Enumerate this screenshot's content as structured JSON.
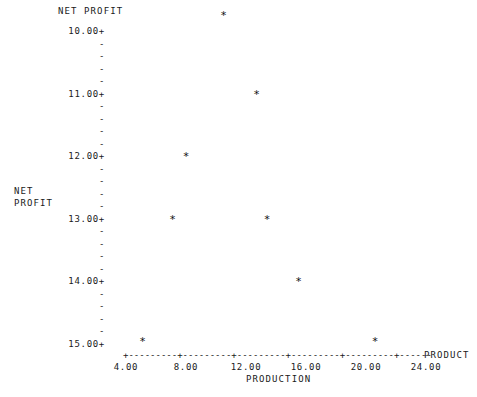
{
  "title": "NET PROFIT",
  "side_label_line1": "NET",
  "side_label_line2": "PROFIT",
  "axis_end_label": "PRODUCT",
  "xaxis_caption": "PRODUCTION",
  "marker_glyph": "*",
  "y_axis": {
    "major_suffix": "+",
    "minor_glyph": "-",
    "labels": [
      "15.00+",
      "14.00+",
      "13.00+",
      "12.00+",
      "11.00+",
      "10.00+"
    ]
  },
  "x_axis": {
    "tick_labels": [
      "4.00",
      "8.00",
      "12.00",
      "16.00",
      "20.00",
      "24.00"
    ],
    "line": "+---------+---------+---------+---------+---------+------"
  },
  "colors": {
    "ink": "#1a1a1a",
    "marker": "#111111",
    "background": "#ffffff"
  },
  "chart_data": {
    "type": "scatter",
    "title": "NET PROFIT",
    "xlabel": "PRODUCTION",
    "ylabel": "NET PROFIT",
    "xlim": [
      4.0,
      24.0
    ],
    "ylim": [
      10.0,
      15.4
    ],
    "xticks": [
      4.0,
      8.0,
      12.0,
      16.0,
      20.0,
      24.0
    ],
    "yticks": [
      10.0,
      11.0,
      12.0,
      13.0,
      14.0,
      15.0
    ],
    "y_minor_step": 0.2,
    "grid": false,
    "legend": false,
    "marker": "*",
    "x": [
      5.1,
      7.1,
      8.0,
      10.5,
      12.7,
      13.4,
      15.5,
      20.6
    ],
    "y": [
      10.05,
      12.0,
      13.0,
      15.25,
      14.0,
      12.0,
      11.0,
      10.05
    ],
    "points": [
      {
        "x": 5.1,
        "y": 10.05
      },
      {
        "x": 7.1,
        "y": 12.0
      },
      {
        "x": 8.0,
        "y": 13.0
      },
      {
        "x": 10.5,
        "y": 15.25
      },
      {
        "x": 12.7,
        "y": 14.0
      },
      {
        "x": 13.4,
        "y": 12.0
      },
      {
        "x": 15.5,
        "y": 11.0
      },
      {
        "x": 20.6,
        "y": 10.05
      }
    ]
  }
}
